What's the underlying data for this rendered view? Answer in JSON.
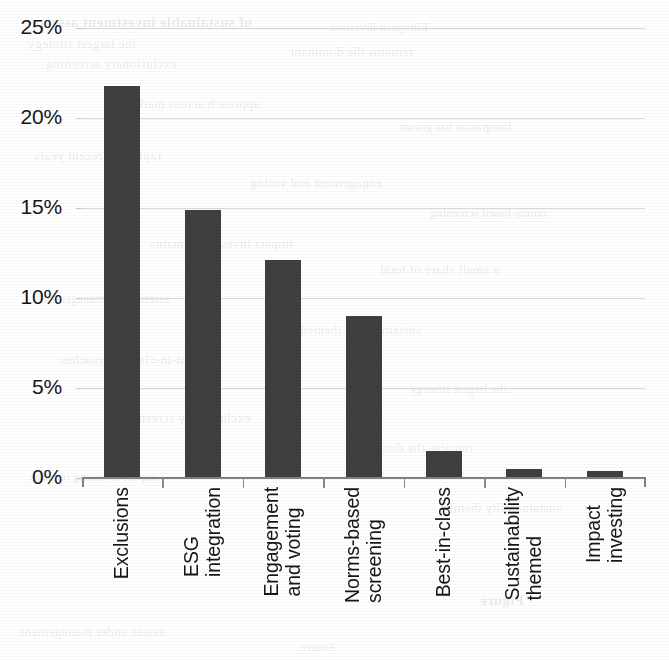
{
  "chart_data": {
    "type": "bar",
    "title": "",
    "subtitle": "",
    "xlabel": "",
    "ylabel": "",
    "categories": [
      "Exclusions",
      "ESG\nintegration",
      "Engagement\nand voting",
      "Norms-based\nscreening",
      "Best-in-class",
      "Sustainability\nthemed",
      "Impact\ninvesting"
    ],
    "values": [
      21.8,
      14.9,
      12.1,
      9.0,
      1.5,
      0.5,
      0.4
    ],
    "value_labels": [
      "21.8%",
      "14.9%",
      "12.1%",
      "9.0%",
      "1.5%",
      "0.5%",
      "0.4%"
    ],
    "ylim": [
      0,
      25
    ],
    "ytick_values": [
      25,
      20,
      15,
      10,
      5,
      0
    ],
    "ytick_labels": [
      "25%",
      "20%",
      "15%",
      "10%",
      "5%",
      "0%"
    ],
    "grid": true,
    "legend": false,
    "legend_position": "none",
    "series": [
      {
        "name": "Share of sustainable investing assets",
        "values": [
          21.8,
          14.9,
          12.1,
          9.0,
          1.5,
          0.5,
          0.4
        ],
        "color": "#3f3f3f"
      }
    ]
  },
  "colors": {
    "bar": "#3f3f3f",
    "gridline": "#d9d9d9",
    "axis": "#808080",
    "tick": "#8a8a8a",
    "text": "#161616",
    "background": "#ffffff"
  },
  "bleed_through": {
    "lines": [
      "of sustainable investment assets",
      "the largest strategy",
      "exclusionary screening",
      "European investors",
      "remains the dominant",
      "approach across markets",
      "integration has grown",
      "rapidly in recent years",
      "engagement and voting",
      "norms-based screening",
      "impact investing remains",
      "a small share of total",
      "assets under management",
      "sustainability themed",
      "best-in-class approaches",
      "strategy",
      "Figure",
      "Source"
    ]
  }
}
